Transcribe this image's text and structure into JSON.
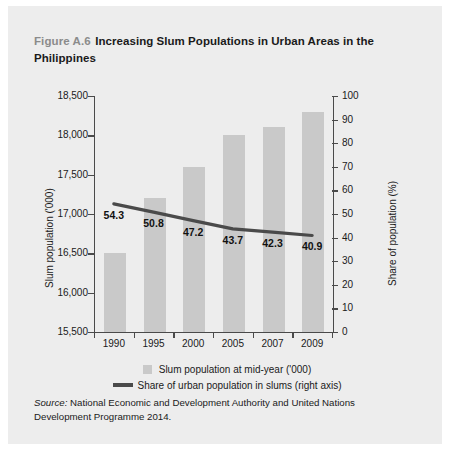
{
  "figure": {
    "number": "Figure A.6",
    "title": "Increasing Slum Populations in Urban Areas in the Philippines",
    "source_label": "Source:",
    "source_text": "National Economic and Development Authority and United Nations Development Programme 2014."
  },
  "colors": {
    "panel_background": "#ededed",
    "bar": "#c9c9c9",
    "line": "#4a4a4a",
    "axis": "#4a4a4a",
    "text": "#1a1a1a",
    "figure_number": "#8b8b8b"
  },
  "chart_data": {
    "type": "bar",
    "title": "Increasing Slum Populations in Urban Areas in the Philippines",
    "xlabel": "",
    "ylabel": "Slum population ('000)",
    "y2label": "Share of population (%)",
    "categories": [
      "1990",
      "1995",
      "2000",
      "2005",
      "2007",
      "2009"
    ],
    "ylim": [
      15500,
      18500
    ],
    "y2lim": [
      0,
      100
    ],
    "yticks": [
      "18,500",
      "18,000",
      "17,500",
      "17,000",
      "16,500",
      "16,000",
      "15,500"
    ],
    "ytick_values": [
      18500,
      18000,
      17500,
      17000,
      16500,
      16000,
      15500
    ],
    "y2ticks": [
      "100",
      "90",
      "80",
      "70",
      "60",
      "50",
      "40",
      "30",
      "20",
      "10",
      "0"
    ],
    "y2tick_values": [
      100,
      90,
      80,
      70,
      60,
      50,
      40,
      30,
      20,
      10,
      0
    ],
    "grid": false,
    "legend_position": "bottom",
    "series": [
      {
        "name": "Slum population at mid-year ('000)",
        "type": "bar",
        "axis": "left",
        "values": [
          16500,
          17200,
          17600,
          18000,
          18100,
          18300
        ]
      },
      {
        "name": "Share of urban population in slums (right axis)",
        "type": "line",
        "axis": "right",
        "values": [
          54.3,
          50.8,
          47.2,
          43.7,
          42.3,
          40.9
        ],
        "data_labels": [
          "54.3",
          "50.8",
          "47.2",
          "43.7",
          "42.3",
          "40.9"
        ]
      }
    ]
  }
}
